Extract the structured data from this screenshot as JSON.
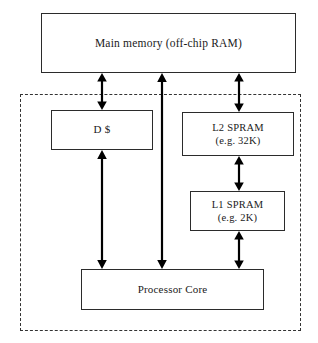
{
  "diagram": {
    "background_color": "#ffffff",
    "line_color": "#2b2b2b",
    "arrow_color": "#000000",
    "chip_boundary": {
      "label": "on-chip boundary",
      "style": "dashed"
    },
    "blocks": [
      {
        "id": "main-memory",
        "line1": "Main memory (off-chip RAM)",
        "line2": ""
      },
      {
        "id": "dcache",
        "line1": "D $",
        "line2": ""
      },
      {
        "id": "l2-spram",
        "line1": "L2 SPRAM",
        "line2": "(e.g. 32K)"
      },
      {
        "id": "l1-spram",
        "line1": "L1 SPRAM",
        "line2": "(e.g. 2K)"
      },
      {
        "id": "processor-core",
        "line1": "Processor Core",
        "line2": ""
      }
    ],
    "connectors": [
      {
        "id": "mem-to-dcache",
        "from": "main-memory",
        "to": "dcache",
        "kind": "double-arrow-vertical"
      },
      {
        "id": "mem-to-core",
        "from": "main-memory",
        "to": "processor-core",
        "kind": "double-arrow-vertical"
      },
      {
        "id": "mem-to-l2",
        "from": "main-memory",
        "to": "l2-spram",
        "kind": "double-arrow-vertical"
      },
      {
        "id": "dcache-to-core",
        "from": "dcache",
        "to": "processor-core",
        "kind": "double-arrow-vertical"
      },
      {
        "id": "l2-to-l1",
        "from": "l2-spram",
        "to": "l1-spram",
        "kind": "double-arrow-vertical"
      },
      {
        "id": "l1-to-core",
        "from": "l1-spram",
        "to": "processor-core",
        "kind": "double-arrow-vertical"
      }
    ]
  }
}
